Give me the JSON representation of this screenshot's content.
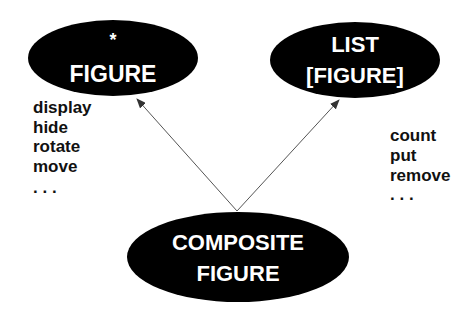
{
  "diagram": {
    "colors": {
      "node_fill": "#000000",
      "node_text": "#ffffff",
      "edge": "#444444",
      "feature_text": "#111111",
      "background": "#ffffff"
    },
    "nodes": [
      {
        "id": "figure",
        "lines": [
          "*",
          "FIGURE"
        ],
        "shape": "ellipse"
      },
      {
        "id": "list_figure",
        "lines": [
          "LIST",
          "[FIGURE]"
        ],
        "shape": "ellipse"
      },
      {
        "id": "composite_figure",
        "lines": [
          "COMPOSITE",
          "FIGURE"
        ],
        "shape": "ellipse"
      }
    ],
    "edges": [
      {
        "from": "composite_figure",
        "to": "figure",
        "type": "inherits-arrow"
      },
      {
        "from": "composite_figure",
        "to": "list_figure",
        "type": "inherits-arrow"
      }
    ],
    "features": {
      "figure": [
        "display",
        "hide",
        "rotate",
        "move",
        ". . ."
      ],
      "list_figure": [
        "count",
        "put",
        "remove",
        ". . ."
      ]
    }
  }
}
